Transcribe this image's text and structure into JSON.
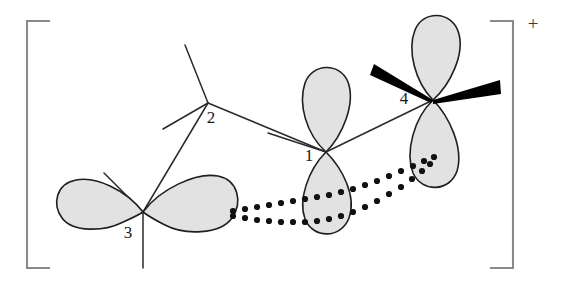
{
  "figure": {
    "charge": "+",
    "bracket_color": "#8a8a8a",
    "bond_color": "#2a2a2a",
    "lobe_fill": "#e2e2e2",
    "lobe_stroke": "#1f1f1f",
    "wedge_color": "#000000",
    "dotted_color": "#111111"
  },
  "atoms": [
    {
      "id": "1",
      "label": "1",
      "x": 326,
      "y": 152,
      "label_x": 309,
      "label_y": 161,
      "type": "sp2-center-vertical-p-orbital"
    },
    {
      "id": "2",
      "label": "2",
      "x": 208,
      "y": 103,
      "label_x": 211,
      "label_y": 123,
      "type": "sp3-carbon"
    },
    {
      "id": "3",
      "label": "3",
      "x": 143,
      "y": 212,
      "label_x": 128,
      "label_y": 238,
      "type": "sp2-center-horizontal-p-orbital"
    },
    {
      "id": "4",
      "label": "4",
      "x": 433,
      "y": 100,
      "label_x": 404,
      "label_y": 104,
      "type": "sp2-center-vertical-p-orbital-with-wedges"
    }
  ],
  "bonds": [
    {
      "name": "bond-2-to-upper",
      "from": [
        208,
        103
      ],
      "to": [
        185,
        45
      ],
      "style": "line"
    },
    {
      "name": "bond-2-to-lower-left",
      "from": [
        208,
        103
      ],
      "to": [
        163,
        129
      ],
      "style": "line"
    },
    {
      "name": "bond-2-to-atom-3",
      "from": [
        208,
        103
      ],
      "to": [
        143,
        212
      ],
      "style": "line"
    },
    {
      "name": "bond-2-to-atom-1",
      "from": [
        208,
        103
      ],
      "to": [
        326,
        152
      ],
      "style": "line"
    },
    {
      "name": "bond-1-to-left",
      "from": [
        326,
        152
      ],
      "to": [
        268,
        133
      ],
      "style": "line"
    },
    {
      "name": "bond-1-to-atom-4",
      "from": [
        326,
        152
      ],
      "to": [
        433,
        100
      ],
      "style": "line"
    },
    {
      "name": "bond-3-to-upper-left",
      "from": [
        143,
        212
      ],
      "to": [
        104,
        173
      ],
      "style": "line"
    },
    {
      "name": "bond-3-to-down",
      "from": [
        143,
        212
      ],
      "to": [
        143,
        268
      ],
      "style": "line"
    },
    {
      "name": "wedge-4-upper-left",
      "from": [
        433,
        100
      ],
      "to": [
        378,
        70
      ],
      "style": "bold-wedge"
    },
    {
      "name": "wedge-4-right",
      "from": [
        433,
        100
      ],
      "to": [
        500,
        86
      ],
      "style": "bold-wedge"
    }
  ],
  "orbitals": [
    {
      "name": "p-orbital-atom-1",
      "orientation": "vertical",
      "center": [
        326,
        152
      ]
    },
    {
      "name": "p-orbital-atom-3",
      "orientation": "horizontal",
      "center": [
        143,
        212
      ]
    },
    {
      "name": "p-orbital-atom-4",
      "orientation": "vertical",
      "center": [
        433,
        100
      ]
    }
  ],
  "delocalization": {
    "name": "dotted-overlap-lines",
    "description": "Two dotted lines indicating pi delocalization from orbital 3 through orbital 1 to orbital 4",
    "dot_radius": 3.1
  },
  "bracket": {
    "left_x": 27,
    "right_x": 513,
    "top_y": 21,
    "bottom_y": 268,
    "tick": 22,
    "charge_x": 533,
    "charge_y": 30
  }
}
